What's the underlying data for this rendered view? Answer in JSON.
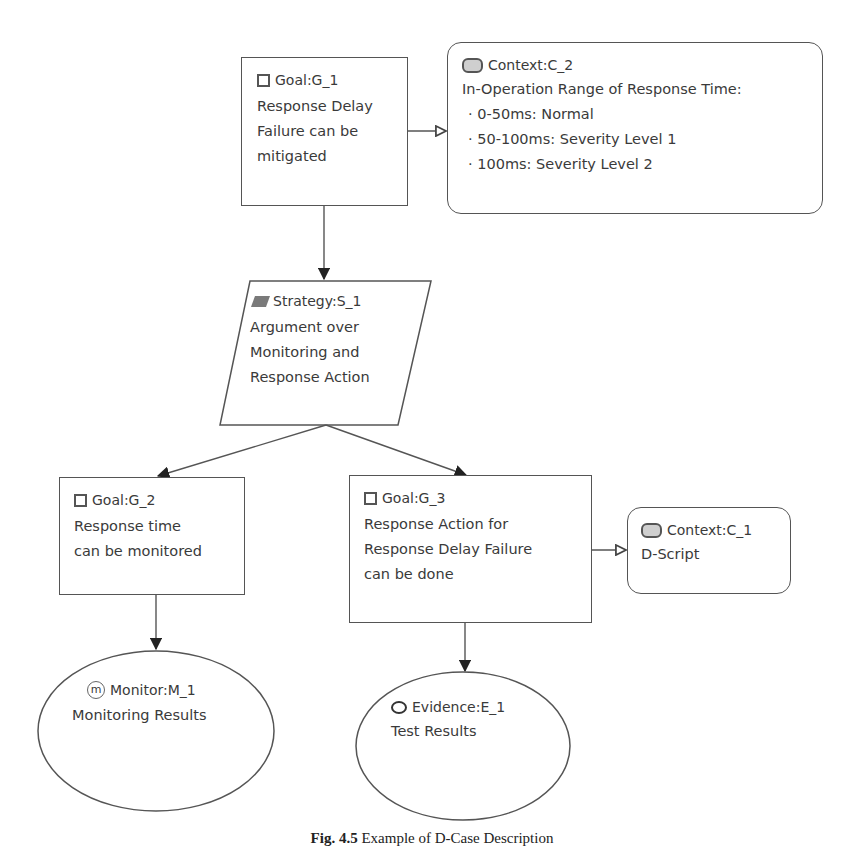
{
  "diagram": {
    "type": "GSN / D-Case argument tree",
    "nodes": {
      "g1": {
        "kind": "Goal",
        "id": "G_1",
        "label": "Goal:G_1",
        "lines": [
          "Response Delay",
          "Failure can be",
          "mitigated"
        ]
      },
      "c2": {
        "kind": "Context",
        "id": "C_2",
        "label": "Context:C_2",
        "heading": "In-Operation Range of Response Time:",
        "bullets": [
          "0-50ms: Normal",
          "50-100ms: Severity Level 1",
          "100ms: Severity Level 2"
        ]
      },
      "s1": {
        "kind": "Strategy",
        "id": "S_1",
        "label": "Strategy:S_1",
        "lines": [
          "Argument over",
          "Monitoring and",
          "Response Action"
        ]
      },
      "g2": {
        "kind": "Goal",
        "id": "G_2",
        "label": "Goal:G_2",
        "lines": [
          "Response time",
          "can be monitored"
        ]
      },
      "g3": {
        "kind": "Goal",
        "id": "G_3",
        "label": "Goal:G_3",
        "lines": [
          "Response Action for",
          "Response Delay Failure",
          "can be done"
        ]
      },
      "c1": {
        "kind": "Context",
        "id": "C_1",
        "label": "Context:C_1",
        "lines": [
          "D-Script"
        ]
      },
      "m1": {
        "kind": "Monitor",
        "id": "M_1",
        "label": "Monitor:M_1",
        "icon_glyph": "m",
        "lines": [
          "Monitoring Results"
        ]
      },
      "e1": {
        "kind": "Evidence",
        "id": "E_1",
        "label": "Evidence:E_1",
        "lines": [
          "Test Results"
        ]
      }
    },
    "edges": [
      {
        "from": "G_1",
        "to": "C_2",
        "type": "in-context-of"
      },
      {
        "from": "G_1",
        "to": "S_1",
        "type": "supported-by"
      },
      {
        "from": "S_1",
        "to": "G_2",
        "type": "supported-by"
      },
      {
        "from": "S_1",
        "to": "G_3",
        "type": "supported-by"
      },
      {
        "from": "G_3",
        "to": "C_1",
        "type": "in-context-of"
      },
      {
        "from": "G_2",
        "to": "M_1",
        "type": "supported-by"
      },
      {
        "from": "G_3",
        "to": "E_1",
        "type": "supported-by"
      }
    ]
  },
  "caption": {
    "prefix": "Fig. 4.5",
    "text": "Example of D-Case Description"
  }
}
